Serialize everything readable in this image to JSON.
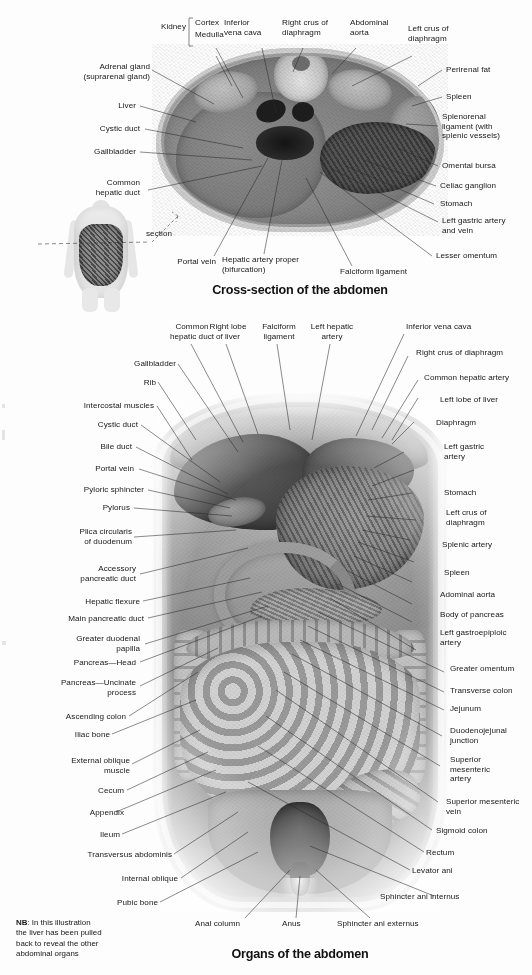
{
  "page": {
    "background_color": "#fdfdfd",
    "text_color": "#171717",
    "leader_line_color": "#2b2b2b",
    "width": 532,
    "height": 975
  },
  "figure_1": {
    "caption": "Cross-section of the abdomen",
    "section_indicator_label": "section",
    "bracket_group_label": "Kidney",
    "labels_top": [
      {
        "text": "Kidney"
      },
      {
        "text": "Cortex"
      },
      {
        "text": "Medulla"
      },
      {
        "text": "Inferior\nvena cava"
      },
      {
        "text": "Right crus of\ndiaphragm"
      },
      {
        "text": "Abdominal\naorta"
      },
      {
        "text": "Left crus of\ndiaphragm"
      }
    ],
    "labels_left": [
      {
        "text": "Adrenal gland\n(suprarenal gland)"
      },
      {
        "text": "Liver"
      },
      {
        "text": "Cystic duct"
      },
      {
        "text": "Gallbladder"
      },
      {
        "text": "Common\nhepatic duct"
      }
    ],
    "labels_right": [
      {
        "text": "Perirenal fat"
      },
      {
        "text": "Spleen"
      },
      {
        "text": "Splenorenal\nligament (with\nsplenic vessels)"
      },
      {
        "text": "Omental bursa"
      },
      {
        "text": "Celiac ganglion"
      },
      {
        "text": "Stomach"
      },
      {
        "text": "Left gastric artery\nand vein"
      },
      {
        "text": "Lesser omentum"
      }
    ],
    "labels_bottom": [
      {
        "text": "Portal vein"
      },
      {
        "text": "Hepatic artery proper\n(bifurcation)"
      },
      {
        "text": "Falciform ligament"
      }
    ]
  },
  "figure_2": {
    "caption": "Organs of the abdomen",
    "note": {
      "prefix": "NB",
      "text": ": In this illustration\nthe liver has been pulled\nback to reveal the other\nabdominal organs"
    },
    "labels_top": [
      {
        "text": "Common\nhepatic duct"
      },
      {
        "text": "Right lobe\nof liver"
      },
      {
        "text": "Falciform\nligament"
      },
      {
        "text": "Left hepatic\nartery"
      },
      {
        "text": "Inferior vena cava"
      }
    ],
    "labels_left": [
      {
        "text": "Gallbladder"
      },
      {
        "text": "Rib"
      },
      {
        "text": "Intercostal muscles"
      },
      {
        "text": "Cystic duct"
      },
      {
        "text": "Bile duct"
      },
      {
        "text": "Portal vein"
      },
      {
        "text": "Pyloric sphincter"
      },
      {
        "text": "Pylorus"
      },
      {
        "text": "Plica circularis\nof duodenum"
      },
      {
        "text": "Accessory\npancreatic duct"
      },
      {
        "text": "Hepatic flexure"
      },
      {
        "text": "Main pancreatic duct"
      },
      {
        "text": "Greater duodenal\npapilla"
      },
      {
        "text": "Pancreas—Head"
      },
      {
        "text": "Pancreas—Uncinate\nprocess"
      },
      {
        "text": "Ascending colon"
      },
      {
        "text": "Iliac bone"
      },
      {
        "text": "External oblique\nmuscle"
      },
      {
        "text": "Cecum"
      },
      {
        "text": "Appendix"
      },
      {
        "text": "Ileum"
      },
      {
        "text": "Transversus abdominis"
      },
      {
        "text": "Internal oblique"
      },
      {
        "text": "Pubic bone"
      }
    ],
    "labels_right": [
      {
        "text": "Right crus of diaphragm"
      },
      {
        "text": "Common hepatic artery"
      },
      {
        "text": "Left lobe of liver"
      },
      {
        "text": "Diaphragm"
      },
      {
        "text": "Left gastric\nartery"
      },
      {
        "text": "Stomach"
      },
      {
        "text": "Left crus of\ndiaphragm"
      },
      {
        "text": "Splenic artery"
      },
      {
        "text": "Spleen"
      },
      {
        "text": "Adominal aorta"
      },
      {
        "text": "Body of pancreas"
      },
      {
        "text": "Left gastroepiploic\nartery"
      },
      {
        "text": "Greater omentum"
      },
      {
        "text": "Transverse colon"
      },
      {
        "text": "Jejunum"
      },
      {
        "text": "Duodenojejunal\njunction"
      },
      {
        "text": "Superior\nmesenteric\nartery"
      },
      {
        "text": "Superior mesenteric\nvein"
      },
      {
        "text": "Sigmoid colon"
      },
      {
        "text": "Rectum"
      },
      {
        "text": "Levator ani"
      },
      {
        "text": "Sphincter ani internus"
      }
    ],
    "labels_bottom": [
      {
        "text": "Anal column"
      },
      {
        "text": "Anus"
      },
      {
        "text": "Sphincter ani externus"
      }
    ]
  }
}
